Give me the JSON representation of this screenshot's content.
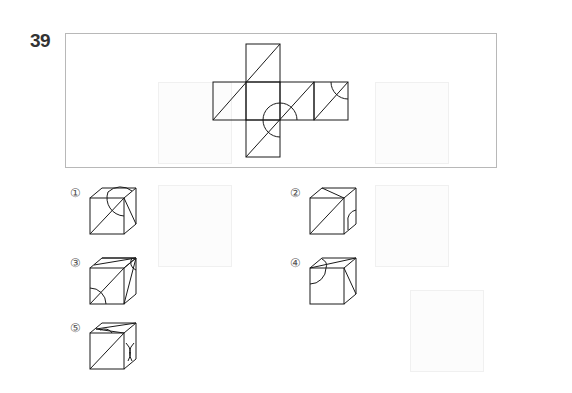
{
  "question": {
    "number": "39",
    "figure": {
      "type": "cube-net",
      "description": "Cross-shaped cube net with diagonal lines and arc markings"
    },
    "options": [
      {
        "id": 1,
        "label": "①"
      },
      {
        "id": 2,
        "label": "②"
      },
      {
        "id": 3,
        "label": "③"
      },
      {
        "id": 4,
        "label": "④"
      },
      {
        "id": 5,
        "label": "⑤"
      }
    ]
  }
}
